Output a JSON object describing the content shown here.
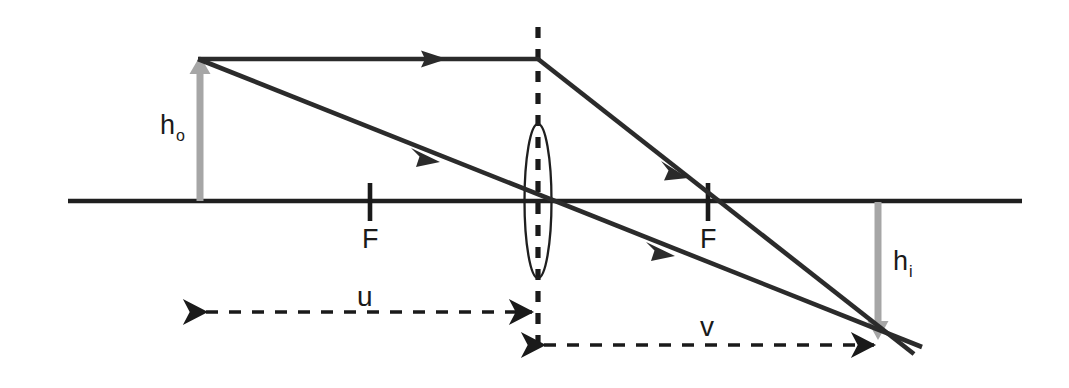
{
  "figure": {
    "type": "optics-ray-diagram",
    "background_color": "#ffffff",
    "line_color": "#2b2b2b",
    "object_image_arrow_color": "#a6a6a6",
    "text_color": "#1a1a1a",
    "width": 1069,
    "height": 388
  },
  "labels": {
    "object_height": {
      "base": "h",
      "sub": "o",
      "x": 160,
      "y": 112
    },
    "image_height": {
      "base": "h",
      "sub": "i",
      "x": 893,
      "y": 248
    },
    "focal_left": {
      "text": "F",
      "x": 362,
      "y": 226
    },
    "focal_right": {
      "text": "F",
      "x": 700,
      "y": 226
    },
    "object_distance": {
      "text": "u",
      "x": 357,
      "y": 283
    },
    "image_distance": {
      "text": "v",
      "x": 700,
      "y": 313
    }
  },
  "geometry": {
    "optical_axis": {
      "x1": 68,
      "y1": 201,
      "x2": 1022,
      "y2": 201
    },
    "lens": {
      "center_x": 538,
      "center_y": 201,
      "rx": 13,
      "ry": 77
    },
    "lens_plane_dashed": {
      "x": 538,
      "y1": 27,
      "y2": 356
    },
    "object_arrow": {
      "x": 200,
      "y_base": 201,
      "y_tip": 59
    },
    "image_arrow": {
      "x": 878,
      "y_base": 201,
      "y_tip": 337
    },
    "focal_point_left": {
      "x": 370,
      "tick_y1": 183,
      "tick_y2": 221
    },
    "focal_point_right": {
      "x": 708,
      "tick_y1": 183,
      "tick_y2": 221
    },
    "ray_parallel": {
      "x1": 200,
      "y1": 59,
      "x2": 538,
      "y2": 59
    },
    "ray_refracted": {
      "x1": 538,
      "y1": 59,
      "x2": 912,
      "y2": 352
    },
    "ray_through_center": {
      "x1": 200,
      "y1": 59,
      "x2": 920,
      "y2": 345
    },
    "dimension_u": {
      "x1": 202,
      "x2": 536,
      "y": 312
    },
    "dimension_v": {
      "x1": 540,
      "x2": 878,
      "y": 345
    }
  },
  "arrowheads": {
    "ray_parallel_mid": {
      "x": 435,
      "y": 59
    },
    "ray_center_upper": {
      "x": 428,
      "y": 156
    },
    "ray_center_lower": {
      "x": 663,
      "y": 251
    },
    "ray_refracted_mid": {
      "x": 678,
      "y": 169
    }
  }
}
